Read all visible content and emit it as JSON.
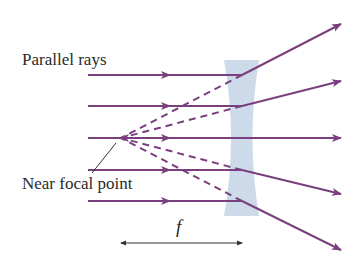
{
  "diagram": {
    "labels": {
      "parallel_rays": "Parallel rays",
      "near_focal_point": "Near focal point",
      "focal_length": "f"
    },
    "colors": {
      "ray": "#7a3f7e",
      "lens": "#c6d6e8",
      "text": "#2a2a2a",
      "pointer": "#333333",
      "dimension": "#333333"
    },
    "lens": {
      "type": "diverging (concave)",
      "top_y": 60,
      "bottom_y": 216,
      "waist_y": 138,
      "center_x": 242
    },
    "focal_point": {
      "x": 120,
      "y": 138
    },
    "rays": [
      {
        "incident_y": 75,
        "exit_end": [
          341,
          24
        ],
        "virtual_extension": "dashed back to focal point"
      },
      {
        "incident_y": 106,
        "exit_end": [
          341,
          81
        ],
        "virtual_extension": "dashed back to focal point"
      },
      {
        "incident_y": 138,
        "exit_end": [
          341,
          138
        ],
        "virtual_extension": "none (axis ray)"
      },
      {
        "incident_y": 170,
        "exit_end": [
          341,
          194
        ],
        "virtual_extension": "dashed back to focal point"
      },
      {
        "incident_y": 201,
        "exit_end": [
          341,
          250
        ],
        "virtual_extension": "dashed back to focal point"
      }
    ],
    "focal_length_arrow": {
      "x_start": 121,
      "x_end": 242,
      "y": 243
    }
  }
}
